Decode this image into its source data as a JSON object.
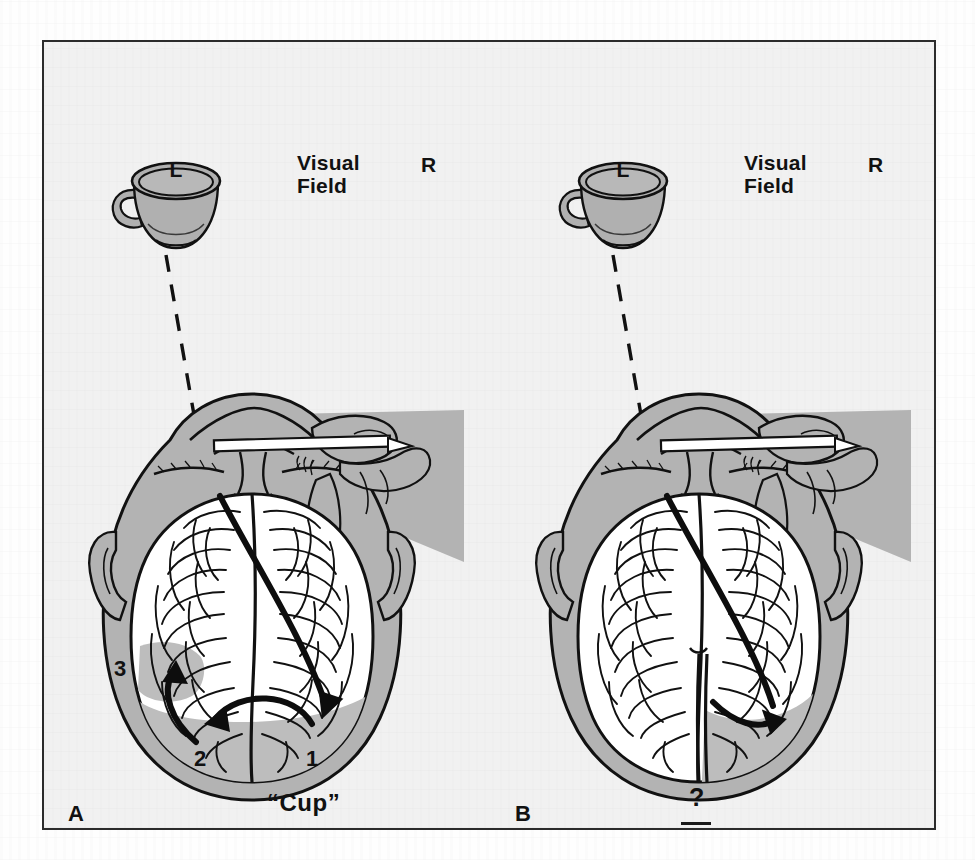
{
  "figure": {
    "type": "anatomical-diagram",
    "background_color": "#f1f1f1",
    "page_color": "#fefefe",
    "border_color": "#2b2b2b",
    "ink_color": "#111111",
    "scalp_gray": "#b3b3b3",
    "shade_gray": "#bdbdbd",
    "cup_gray": "#b0b0b0",
    "brain_white": "#ffffff"
  },
  "panels": [
    {
      "id": "A",
      "letter": "A",
      "visual_field": {
        "title_line1": "Visual",
        "title_line2": "Field",
        "left_label": "L",
        "right_label": "R"
      },
      "cup": {
        "label": "L",
        "name": "coffee-cup"
      },
      "pathway_numbers": [
        "1",
        "2",
        "3"
      ],
      "callosum_intact": true,
      "response": "“Cup”",
      "response_kind": "spoken-word",
      "arrows": 3
    },
    {
      "id": "B",
      "letter": "B",
      "visual_field": {
        "title_line1": "Visual",
        "title_line2": "Field",
        "left_label": "L",
        "right_label": "R"
      },
      "cup": {
        "label": "L",
        "name": "coffee-cup"
      },
      "pathway_numbers": [],
      "callosum_intact": false,
      "response": "?",
      "response_kind": "unknown",
      "arrows": 1
    }
  ]
}
